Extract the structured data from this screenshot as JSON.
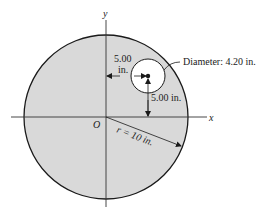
{
  "figure": {
    "type": "disk-with-hole",
    "fill_color": "#d9d9d9",
    "line_color": "#1a1a1a",
    "disk": {
      "radius_in": 10,
      "radius_label": "r = 10 in."
    },
    "hole": {
      "x_offset_in": 5.0,
      "y_offset_in": 5.0,
      "diameter_in": 4.2,
      "diameter_label": "Diameter: 4.20 in."
    },
    "labels": {
      "y_axis": "y",
      "x_axis": "x",
      "origin": "O",
      "horizontal_dim_value": "5.00",
      "horizontal_dim_unit": "in.",
      "vertical_dim": "5.00 in."
    }
  }
}
